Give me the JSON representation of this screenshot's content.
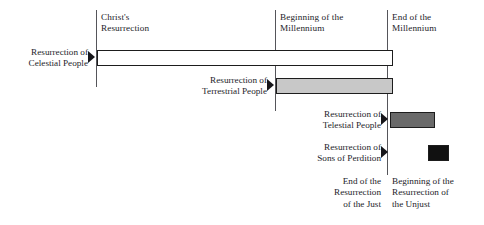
{
  "diagram": {
    "width": 484,
    "height": 225,
    "background": "#ffffff",
    "line_color": "#55555a",
    "text_color": "#24242a",
    "bar_border_color": "#1d1d1d"
  },
  "column_headers": [
    {
      "label": "Christ's\nResurrection",
      "x": 101,
      "y": 12
    },
    {
      "label": "Beginning of the\nMillennium",
      "x": 280,
      "y": 12
    },
    {
      "label": "End of the\nMillennium",
      "x": 392,
      "y": 12
    }
  ],
  "dividers": [
    {
      "name": "christs-resurrection-line",
      "x": 96,
      "y": 10,
      "height": 77
    },
    {
      "name": "beginning-millennium-line",
      "x": 275,
      "y": 10,
      "height": 101
    },
    {
      "name": "end-millennium-line",
      "x": 387,
      "y": 10,
      "height": 165
    }
  ],
  "rows": [
    {
      "name": "celestial",
      "label": "Resurrection of\nCelestial People",
      "label_x": 0,
      "label_y": 47,
      "label_width": 88,
      "pointer_x": 88,
      "pointer_y": 51,
      "bar": {
        "x": 97,
        "y": 50,
        "width": 296,
        "height": 16,
        "fill": "#ffffff"
      }
    },
    {
      "name": "terrestrial",
      "label": "Resurrection of\nTerrestrial People",
      "label_x": 178,
      "label_y": 75,
      "label_width": 89,
      "pointer_x": 267,
      "pointer_y": 79,
      "bar": {
        "x": 276,
        "y": 78,
        "width": 117,
        "height": 16,
        "fill": "#c8c8c8"
      }
    },
    {
      "name": "telestial",
      "label": "Resurrection of\nTelestial People",
      "label_x": 295,
      "label_y": 109,
      "label_width": 86,
      "pointer_x": 381,
      "pointer_y": 113,
      "bar": {
        "x": 390,
        "y": 112,
        "width": 45,
        "height": 16,
        "fill": "#6a6a6a"
      }
    },
    {
      "name": "sons-of-perdition",
      "label": "Resurrection of\nSons of Perdition",
      "label_x": 290,
      "label_y": 142,
      "label_width": 91,
      "pointer_x": 381,
      "pointer_y": 146,
      "bar": {
        "x": 428,
        "y": 145,
        "width": 21,
        "height": 16,
        "fill": "#111111"
      }
    }
  ],
  "footer": [
    {
      "name": "end-resurrection-just",
      "label": "End of the\nResurrection\nof the Just",
      "x": 282,
      "y": 176,
      "width": 99,
      "align": "right"
    },
    {
      "name": "beginning-resurrection-unjust",
      "label": "Beginning of the\nResurrection of\nthe Unjust",
      "x": 392,
      "y": 176,
      "width": 92,
      "align": "left"
    }
  ]
}
